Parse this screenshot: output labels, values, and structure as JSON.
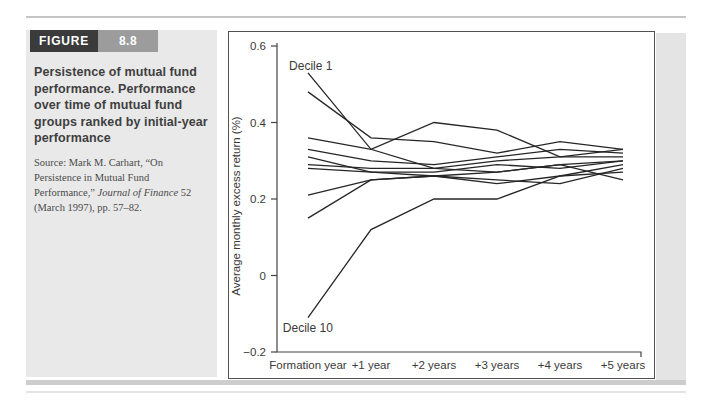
{
  "figure": {
    "label": "FIGURE",
    "number": "8.8",
    "caption": "Persistence of mutual fund performance. Performance over time of mutual fund groups ranked by initial-year performance",
    "source_prefix": "Source: Mark M. Carhart, “On Persistence in Mutual Fund Performance,” ",
    "source_journal": "Journal of Finance",
    "source_suffix": " 52 (March 1997), pp. 57–82."
  },
  "colors": {
    "sidebar_bg": "#e9e9e9",
    "figure_label_bg": "#3b3b3b",
    "figure_number_bg": "#9c9c9c",
    "rule_gray": "#c6c6c6",
    "chart_border": "#515151",
    "line_color": "#262626",
    "axis_color": "#444444",
    "text_color": "#3a3a3a"
  },
  "chart_data": {
    "type": "line",
    "title": "",
    "xlabel": "",
    "ylabel": "Average monthly excess return (%)",
    "categories": [
      "Formation year",
      "+1 year",
      "+2 years",
      "+3 years",
      "+4 years",
      "+5 years"
    ],
    "y_ticks": [
      {
        "value": 0.6,
        "label": "0.6"
      },
      {
        "value": 0.4,
        "label": "0.4"
      },
      {
        "value": 0.2,
        "label": "0.2"
      },
      {
        "value": 0,
        "label": "0"
      },
      {
        "value": -0.2,
        "label": "−0.2"
      }
    ],
    "ylim": [
      -0.2,
      0.6
    ],
    "grid": false,
    "legend": "none",
    "annotations": [
      {
        "text": "Decile 1",
        "x_index": -0.3,
        "value": 0.537
      },
      {
        "text": "Decile 10",
        "x_index": -0.4,
        "value": -0.148
      }
    ],
    "series": [
      {
        "name": "Decile 1",
        "values": [
          0.53,
          0.33,
          0.28,
          0.3,
          0.31,
          0.33
        ]
      },
      {
        "name": "Decile 2",
        "values": [
          0.48,
          0.36,
          0.35,
          0.32,
          0.35,
          0.33
        ]
      },
      {
        "name": "Decile 3",
        "values": [
          0.36,
          0.33,
          0.4,
          0.38,
          0.31,
          0.31
        ]
      },
      {
        "name": "Decile 4",
        "values": [
          0.33,
          0.3,
          0.29,
          0.31,
          0.33,
          0.32
        ]
      },
      {
        "name": "Decile 5",
        "values": [
          0.31,
          0.27,
          0.27,
          0.29,
          0.28,
          0.3
        ]
      },
      {
        "name": "Decile 6",
        "values": [
          0.29,
          0.28,
          0.28,
          0.27,
          0.29,
          0.25
        ]
      },
      {
        "name": "Decile 7",
        "values": [
          0.28,
          0.27,
          0.26,
          0.24,
          0.26,
          0.27
        ]
      },
      {
        "name": "Decile 8",
        "values": [
          0.21,
          0.25,
          0.26,
          0.25,
          0.24,
          0.28
        ]
      },
      {
        "name": "Decile 9",
        "values": [
          0.15,
          0.25,
          0.26,
          0.27,
          0.29,
          0.3
        ]
      },
      {
        "name": "Decile 10",
        "values": [
          -0.11,
          0.12,
          0.2,
          0.2,
          0.26,
          0.29
        ]
      }
    ]
  }
}
